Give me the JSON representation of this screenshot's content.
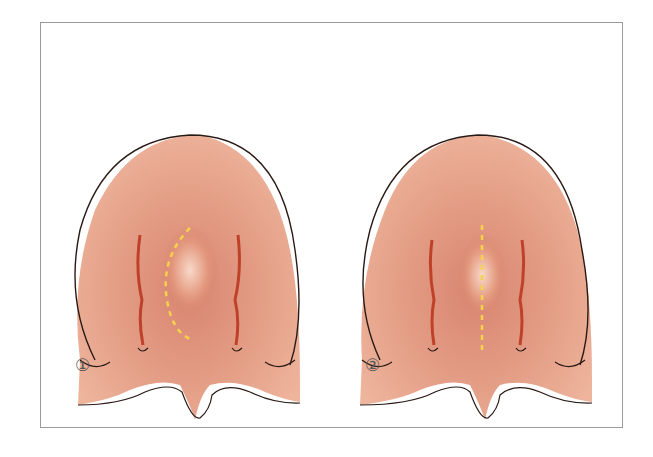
{
  "figure": {
    "panels": [
      {
        "label": "①",
        "incision": "curved dashed line (left paramedian arc)"
      },
      {
        "label": "②",
        "incision": "straight dashed midline"
      }
    ],
    "colors": {
      "tissue": "#e39a7f",
      "tissue_dark": "#c8705a",
      "outline": "#2a1a15",
      "incision": "#f6d24a",
      "vessel": "#c0412a",
      "frame": "#9a9a9a"
    }
  }
}
